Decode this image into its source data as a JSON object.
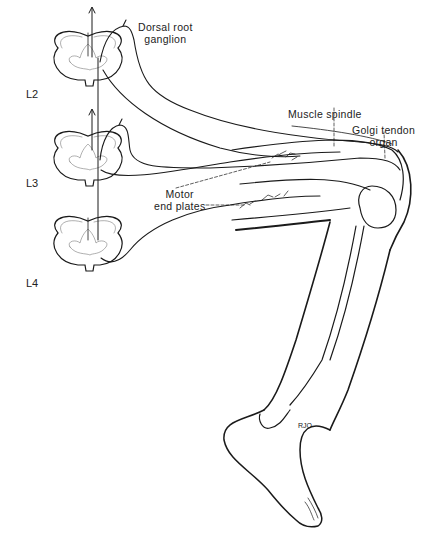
{
  "figure": {
    "colors": {
      "ink": "#1a1a1a",
      "faint": "#7a7a7a",
      "background": "#ffffff"
    },
    "segments": [
      {
        "id": "L2",
        "label": "L2"
      },
      {
        "id": "L3",
        "label": "L3"
      },
      {
        "id": "L4",
        "label": "L4"
      }
    ],
    "labels": {
      "drg_line1": "Dorsal root",
      "drg_line2": "ganglion",
      "muscle_spindle": "Muscle spindle",
      "golgi_line1": "Golgi tendon",
      "golgi_line2": "organ",
      "motor_line1": "Motor",
      "motor_line2": "end plates",
      "signature": "RJO"
    }
  }
}
